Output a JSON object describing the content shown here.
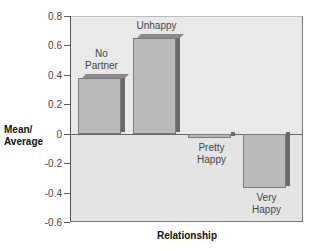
{
  "chart_data": {
    "type": "bar",
    "title": "",
    "xlabel": "Relationship",
    "ylabel": "Mean/ Average",
    "ylabel_lines": [
      "Mean/",
      "Average"
    ],
    "categories": [
      "No Partner",
      "Unhappy",
      "Pretty Happy",
      "Very Happy"
    ],
    "category_label_lines": [
      [
        "No",
        "Partner"
      ],
      [
        "Unhappy"
      ],
      [
        "Pretty",
        "Happy"
      ],
      [
        "Very",
        "Happy"
      ]
    ],
    "values": [
      0.38,
      0.65,
      -0.03,
      -0.37
    ],
    "ylim": [
      -0.6,
      0.8
    ],
    "yticks": [
      0.8,
      0.6,
      0.4,
      0.2,
      0,
      -0.2,
      -0.4,
      -0.6
    ],
    "ytick_labels": [
      "0.8",
      "0.6",
      "0.4",
      "0.2",
      "0",
      "-0.2",
      "-0.4",
      "-0.6"
    ],
    "grid": false,
    "legend": null,
    "style": "3d-bars",
    "colors": {
      "bar_face": "#b9b9b9",
      "bar_top": "#8a8a8a",
      "bar_side": "#6a6a6a",
      "plot_bg": "#e4e4e4"
    }
  }
}
